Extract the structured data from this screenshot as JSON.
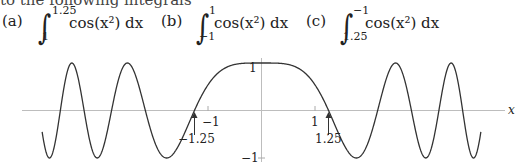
{
  "header": {
    "cutoff_text": "to the following integrals"
  },
  "integrals": [
    {
      "label": "(a)",
      "upper": "1.25",
      "lower": "1",
      "integrand": "cos(x²) dx"
    },
    {
      "label": "(b)",
      "upper": "1",
      "lower": "−1",
      "integrand": "cos(x²) dx"
    },
    {
      "label": "(c)",
      "upper": "−1",
      "lower": "1.25",
      "integrand": "cos(x²) dx"
    }
  ],
  "chart_data": {
    "type": "line",
    "title": "",
    "function": "y = cos(x^2)",
    "xlabel": "x",
    "ylabel": "",
    "xlim": [
      -4.1,
      4.1
    ],
    "ylim": [
      -1,
      1
    ],
    "grid": false,
    "x_ticks": [
      {
        "value": -1,
        "label": "−1"
      },
      {
        "value": 1,
        "label": "1"
      }
    ],
    "y_ticks": [
      {
        "value": 1,
        "label": "1"
      },
      {
        "value": -1,
        "label": "−1"
      }
    ],
    "annotations": [
      {
        "x": -1.25,
        "label": "−1.25",
        "type": "arrow"
      },
      {
        "x": 1.25,
        "label": "1.25",
        "type": "arrow"
      }
    ],
    "series": [
      {
        "name": "cos(x^2)",
        "x_range": [
          -4.1,
          4.1
        ]
      }
    ]
  }
}
